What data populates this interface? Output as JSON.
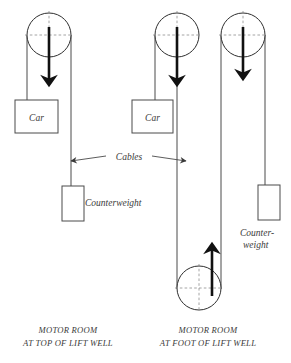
{
  "figure": {
    "type": "technical-diagram",
    "background_color": "#ffffff",
    "line_color": "#4a4a4a",
    "accent_color": "#111111",
    "dash_color": "#8d8d8d"
  },
  "labels": {
    "car": "Car",
    "counterweight": "Counterweight",
    "counterweight_line1": "Counter-",
    "counterweight_line2": "weight",
    "cables": "Cables"
  },
  "captions": {
    "left": {
      "line1": "MOTOR ROOM",
      "line2": "AT TOP OF LIFT WELL"
    },
    "right": {
      "line1": "MOTOR ROOM",
      "line2": "AT FOOT OF LIFT WELL"
    }
  },
  "left_diagram": {
    "name": "motor-room-at-top",
    "pulley": {
      "cx": 49,
      "cy": 35,
      "r": 22
    },
    "drive_arrow": {
      "x": 49,
      "y1": 28,
      "y2": 86,
      "direction": "down"
    },
    "car_box": {
      "x": 15,
      "y": 100,
      "w": 43,
      "h": 33
    },
    "counterweight_box": {
      "x": 62,
      "y": 186,
      "w": 22,
      "h": 35
    },
    "car_cable": {
      "x": 27,
      "y1": 35,
      "y2": 100
    },
    "counterweight_cable": {
      "x": 71,
      "y1": 35,
      "y2": 186
    }
  },
  "right_diagram": {
    "name": "motor-room-at-foot",
    "top_pulley": {
      "cx": 177,
      "cy": 35,
      "r": 22
    },
    "idler_pulley": {
      "cx": 243,
      "cy": 35,
      "r": 22
    },
    "bottom_pulley": {
      "cx": 199,
      "cy": 288,
      "r": 22
    },
    "drive_arrow_top": {
      "x": 177,
      "y1": 28,
      "y2": 86,
      "direction": "down"
    },
    "drive_arrow_idler": {
      "x": 243,
      "y1": 28,
      "y2": 80,
      "direction": "down"
    },
    "drive_arrow_bottom": {
      "x": 212,
      "y1": 295,
      "y2": 243,
      "direction": "up"
    },
    "car_box": {
      "x": 132,
      "y": 100,
      "w": 41,
      "h": 33
    },
    "counterweight_box": {
      "x": 258,
      "y": 185,
      "w": 22,
      "h": 35
    },
    "car_cable": {
      "x": 155,
      "y1": 35,
      "y2": 100
    },
    "long_cable_left": {
      "x": 177,
      "y1": 35,
      "y2": 288
    },
    "long_cable_right": {
      "x": 221,
      "y1": 35,
      "y2": 288
    },
    "counterweight_cable": {
      "x": 265,
      "y1": 35,
      "y2": 185
    }
  },
  "cables_annotation": {
    "label": "Cables",
    "left_arrow_tip_x": 69,
    "right_arrow_tip_x": 189,
    "y": 160,
    "double_headed": true
  }
}
